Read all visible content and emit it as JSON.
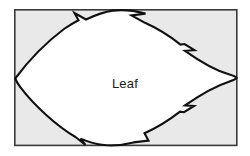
{
  "figure": {
    "name": "leaf-diagram",
    "type": "botanical-outline-diagram",
    "label": "Leaf",
    "background_color": "#ffffff",
    "frame": {
      "name": "bounding-box",
      "fill_color": "#e9e9e9",
      "border_color": "#3a3a3a",
      "x": 14,
      "y": 9,
      "width": 223,
      "height": 137
    },
    "shape": {
      "name": "leaf-outline",
      "fill_color": "#ffffff",
      "stroke_color": "#111111",
      "description": "serrated leaf silhouette with pointed left apex and rounded right lobe",
      "notch_count": 6
    },
    "label_position": {
      "x": 125,
      "y": 84
    }
  }
}
